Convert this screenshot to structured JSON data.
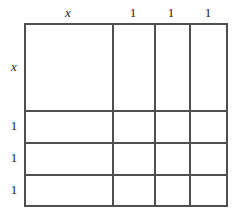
{
  "figure": {
    "kind": "area-model-grid",
    "line_color": "#4f4f4f",
    "background_color": "#ffffff",
    "text_color": "#1a1a1a"
  },
  "column_labels": [
    {
      "text": "x",
      "style": "italic",
      "center_x": 68
    },
    {
      "text": "1",
      "style": "upright",
      "center_x": 133
    },
    {
      "text": "1",
      "style": "upright",
      "center_x": 171
    },
    {
      "text": "1",
      "style": "upright",
      "center_x": 208
    }
  ],
  "row_labels": [
    {
      "text": "x",
      "style": "italic",
      "center_y": 67
    },
    {
      "text": "1",
      "style": "upright",
      "center_y": 126
    },
    {
      "text": "1",
      "style": "upright",
      "center_y": 158
    },
    {
      "text": "1",
      "style": "upright",
      "center_y": 190
    }
  ],
  "grid": {
    "left": 24,
    "top": 23,
    "width": 204,
    "height": 184,
    "column_edges": [
      24,
      112,
      154,
      189,
      228
    ],
    "row_edges": [
      23,
      110,
      142,
      174,
      207
    ],
    "columns": 4,
    "rows": 4,
    "cells": [
      {
        "row": 0,
        "col": 0,
        "value": ""
      },
      {
        "row": 0,
        "col": 1,
        "value": ""
      },
      {
        "row": 0,
        "col": 2,
        "value": ""
      },
      {
        "row": 0,
        "col": 3,
        "value": ""
      },
      {
        "row": 1,
        "col": 0,
        "value": ""
      },
      {
        "row": 1,
        "col": 1,
        "value": ""
      },
      {
        "row": 1,
        "col": 2,
        "value": ""
      },
      {
        "row": 1,
        "col": 3,
        "value": ""
      },
      {
        "row": 2,
        "col": 0,
        "value": ""
      },
      {
        "row": 2,
        "col": 1,
        "value": ""
      },
      {
        "row": 2,
        "col": 2,
        "value": ""
      },
      {
        "row": 2,
        "col": 3,
        "value": ""
      },
      {
        "row": 3,
        "col": 0,
        "value": ""
      },
      {
        "row": 3,
        "col": 1,
        "value": ""
      },
      {
        "row": 3,
        "col": 2,
        "value": ""
      },
      {
        "row": 3,
        "col": 3,
        "value": ""
      }
    ]
  }
}
